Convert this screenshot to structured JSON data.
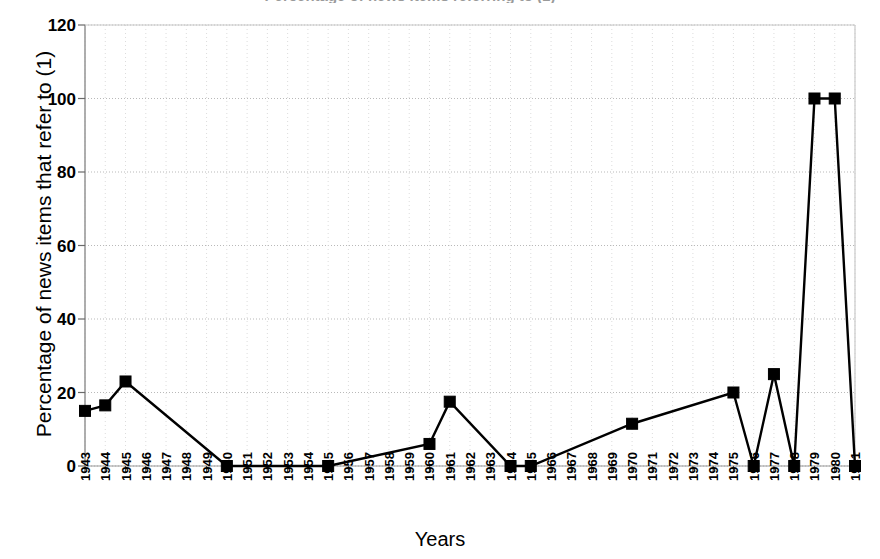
{
  "figure": {
    "clipped_title": "Percentage of news items referring to (1)",
    "background": "#ffffff",
    "ink": "#000000"
  },
  "chart_data": {
    "type": "line",
    "title": "",
    "xlabel": "Years",
    "ylabel": "Percentage of news items that refer to (1)",
    "ylim": [
      0,
      120
    ],
    "yticks": [
      0,
      20,
      40,
      60,
      80,
      100,
      120
    ],
    "grid": true,
    "grid_style": "dotted",
    "legend": "none",
    "marker": "square",
    "marker_color": "#000000",
    "line_color": "#000000",
    "categories": [
      "1943",
      "1944",
      "1945",
      "1946",
      "1947",
      "1948",
      "1949",
      "1950",
      "1951",
      "1952",
      "1953",
      "1954",
      "1955",
      "1956",
      "1957",
      "1958",
      "1959",
      "1960",
      "1961",
      "1962",
      "1963",
      "1964",
      "1965",
      "1966",
      "1967",
      "1968",
      "1969",
      "1970",
      "1971",
      "1972",
      "1973",
      "1974",
      "1975",
      "1976",
      "1977",
      "1978",
      "1979",
      "1980",
      "1981"
    ],
    "series": [
      {
        "name": "Percentage of news items that refer to (1)",
        "points": [
          {
            "x": "1943",
            "y": 15.0
          },
          {
            "x": "1944",
            "y": 16.5
          },
          {
            "x": "1945",
            "y": 23.0
          },
          {
            "x": "1950",
            "y": 0.0
          },
          {
            "x": "1955",
            "y": 0.0
          },
          {
            "x": "1960",
            "y": 6.0
          },
          {
            "x": "1961",
            "y": 17.5
          },
          {
            "x": "1964",
            "y": 0.0
          },
          {
            "x": "1965",
            "y": 0.0
          },
          {
            "x": "1970",
            "y": 11.5
          },
          {
            "x": "1975",
            "y": 20.0
          },
          {
            "x": "1976",
            "y": 0.0
          },
          {
            "x": "1977",
            "y": 25.0
          },
          {
            "x": "1978",
            "y": 0.0
          },
          {
            "x": "1979",
            "y": 100.0
          },
          {
            "x": "1980",
            "y": 100.0
          },
          {
            "x": "1981",
            "y": 0.0
          }
        ]
      }
    ]
  }
}
